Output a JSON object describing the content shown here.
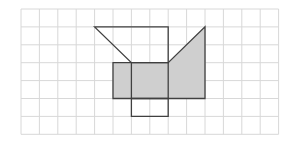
{
  "diagram": {
    "type": "grid-net",
    "grid": {
      "origin_px": [
        21,
        9
      ],
      "cell_w": 18.4,
      "cell_h": 17.9,
      "cols": 14,
      "rows": 7,
      "line_color": "#d8d8d8"
    },
    "stroke_color": "#404040",
    "fill_color": "#cfcfcf",
    "shapes": [
      {
        "name": "shaded-region",
        "filled": true,
        "points": [
          [
            5,
            3
          ],
          [
            8,
            3
          ],
          [
            10,
            1
          ],
          [
            10,
            5
          ],
          [
            5,
            5
          ]
        ]
      },
      {
        "name": "top-trapezoid",
        "filled": false,
        "points": [
          [
            4,
            1
          ],
          [
            8,
            1
          ],
          [
            8,
            3
          ],
          [
            6,
            3
          ]
        ]
      },
      {
        "name": "bottom-square",
        "filled": false,
        "points": [
          [
            6,
            5
          ],
          [
            8,
            5
          ],
          [
            8,
            6
          ],
          [
            6,
            6
          ]
        ]
      }
    ],
    "segments": [
      {
        "name": "inner-line-col6",
        "from": [
          6,
          3
        ],
        "to": [
          6,
          5
        ]
      },
      {
        "name": "inner-line-col8",
        "from": [
          8,
          3
        ],
        "to": [
          8,
          5
        ]
      }
    ]
  }
}
